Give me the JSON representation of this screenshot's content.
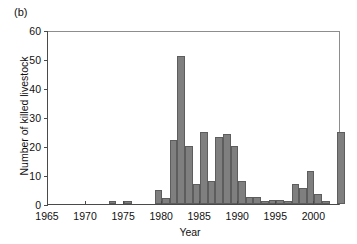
{
  "figure": {
    "panel_label": "(b)"
  },
  "chart_data": {
    "type": "bar",
    "title": "",
    "subtitle": "",
    "xlabel": "Year",
    "ylabel": "Number of killed livestock",
    "xlim": [
      1965,
      2003.5
    ],
    "ylim": [
      0,
      60
    ],
    "xticks": [
      1965,
      1970,
      1975,
      1980,
      1985,
      1990,
      1995,
      2000
    ],
    "xtick_labels": [
      "1965",
      "1970",
      "1975",
      "1980",
      "1985",
      "1990",
      "1995",
      "2000"
    ],
    "yticks": [
      0,
      10,
      20,
      30,
      40,
      50,
      60
    ],
    "ytick_labels": [
      "0",
      "10",
      "20",
      "30",
      "40",
      "50",
      "60"
    ],
    "grid": false,
    "legend": null,
    "bar_color": "#7f7f7f",
    "bar_edge_color": "#5d5d5d",
    "categories": [
      1973,
      1975,
      1979,
      1980,
      1981,
      1982,
      1983,
      1984,
      1985,
      1986,
      1987,
      1988,
      1989,
      1990,
      1991,
      1992,
      1993,
      1994,
      1995,
      1996,
      1997,
      1998,
      1999,
      2000,
      2001,
      2002,
      2003
    ],
    "values": [
      1,
      1,
      5,
      2,
      22,
      51,
      20,
      7,
      25,
      8,
      23,
      24,
      20,
      8,
      2.5,
      2.5,
      1,
      1.5,
      1.5,
      1,
      7,
      5.5,
      11.5,
      3.5,
      1,
      0,
      25
    ],
    "annotations": []
  }
}
